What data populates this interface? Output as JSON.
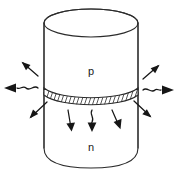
{
  "figure": {
    "background_color": "#ffffff",
    "ink_color": "#2b2b2b",
    "width": 177,
    "height": 176
  },
  "labels": {
    "p_region": "p",
    "n_region": "n"
  },
  "device": {
    "shape": "cylinder",
    "top_region_label": "p",
    "bottom_region_label": "n",
    "junction_style": "hatched-band"
  },
  "arrows": {
    "description": "emitted radiation arrows",
    "left": [
      {
        "name": "arrow-left-upper",
        "direction": "up-left",
        "style": "straight"
      },
      {
        "name": "arrow-left-middle",
        "direction": "left",
        "style": "wavy"
      },
      {
        "name": "arrow-left-lower",
        "direction": "down-left",
        "style": "straight"
      }
    ],
    "right": [
      {
        "name": "arrow-right-upper",
        "direction": "up-right",
        "style": "straight"
      },
      {
        "name": "arrow-right-middle",
        "direction": "right",
        "style": "wavy"
      },
      {
        "name": "arrow-right-lower",
        "direction": "down-right",
        "style": "straight"
      }
    ],
    "down": [
      {
        "name": "arrow-down-left",
        "direction": "down",
        "style": "straight"
      },
      {
        "name": "arrow-down-center",
        "direction": "down",
        "style": "wavy"
      },
      {
        "name": "arrow-down-right",
        "direction": "down-right",
        "style": "straight"
      }
    ]
  }
}
